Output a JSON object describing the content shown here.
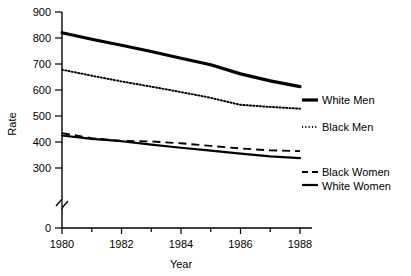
{
  "chart_data": {
    "type": "line",
    "title": "",
    "xlabel": "Year",
    "ylabel": "Rate",
    "x": [
      1980,
      1981,
      1982,
      1983,
      1984,
      1985,
      1986,
      1987,
      1988
    ],
    "xlim": [
      1980,
      1988
    ],
    "ylim": [
      300,
      900
    ],
    "y_axis_break": true,
    "y_break_between": [
      0,
      300
    ],
    "grid": false,
    "legend_position": "right-inline",
    "xticks": [
      1980,
      1982,
      1984,
      1986,
      1988
    ],
    "xtick_labels": [
      "1980",
      "1982",
      "1984",
      "1986",
      "1988"
    ],
    "xminor_ticks": [
      1981,
      1983,
      1985,
      1987
    ],
    "yticks": [
      0,
      300,
      400,
      500,
      600,
      700,
      800,
      900
    ],
    "ytick_labels": [
      "0",
      "300",
      "400",
      "500",
      "600",
      "700",
      "800",
      "900"
    ],
    "series": [
      {
        "name": "White Men",
        "style": "solid-thick",
        "values": [
          820,
          795,
          772,
          748,
          722,
          697,
          662,
          635,
          613
        ]
      },
      {
        "name": "Black Men",
        "style": "dotted",
        "values": [
          678,
          655,
          633,
          613,
          592,
          570,
          543,
          535,
          528
        ]
      },
      {
        "name": "Black Women",
        "style": "dashed",
        "values": [
          434,
          415,
          404,
          402,
          395,
          385,
          375,
          368,
          365
        ]
      },
      {
        "name": "White Women",
        "style": "solid",
        "values": [
          425,
          412,
          403,
          390,
          378,
          367,
          355,
          345,
          338
        ]
      }
    ]
  },
  "axis": {
    "x_title": "Year",
    "y_title": "Rate"
  },
  "labels": {
    "white_men": "White Men",
    "black_men": "Black Men",
    "black_women": "Black Women",
    "white_women": "White Women"
  },
  "colors": {
    "ink": "#000000",
    "background": "#ffffff"
  }
}
